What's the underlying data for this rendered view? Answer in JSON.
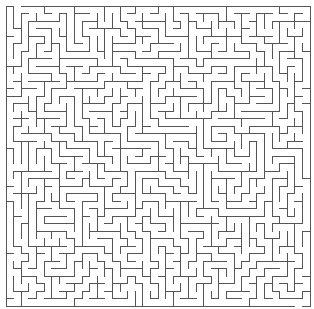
{
  "maze": {
    "cols": 40,
    "rows": 40,
    "origin_x": 5.5,
    "origin_y": 5.5,
    "cell_w": 7.6,
    "cell_h": 7.5,
    "wall_color": "#555555",
    "background": "#ffffff",
    "seed": 20231,
    "entrance": {
      "side": "top",
      "col": 1
    },
    "exit": {
      "side": "bottom",
      "col": 38
    }
  }
}
